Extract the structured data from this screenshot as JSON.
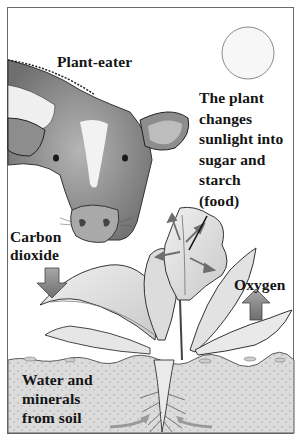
{
  "diagram": {
    "labels": {
      "plant_eater": "Plant-eater",
      "plant_process": "The plant\nchanges\nsunlight into\nsugar and\nstarch\n(food)",
      "carbon_dioxide": "Carbon\ndioxide",
      "oxygen": "Oxygen",
      "water_minerals": "Water and\nminerals\nfrom soil"
    },
    "elements": [
      {
        "name": "sun",
        "icon": "sun-circle"
      },
      {
        "name": "cow",
        "icon": "cow-head"
      },
      {
        "name": "plant",
        "icon": "leafy-plant"
      },
      {
        "name": "carbon-dioxide-arrow",
        "direction": "down"
      },
      {
        "name": "oxygen-arrow",
        "direction": "up"
      },
      {
        "name": "soil",
        "icon": "soil-layer"
      },
      {
        "name": "water-arrows",
        "direction": "inward-to-root"
      }
    ],
    "colors": {
      "border": "#6a6a6a",
      "text": "#141414",
      "soil": "#d8d8d8",
      "arrow_fill": "#8c8c8c",
      "leaf": "#e4e4e4",
      "cow": "#9a9a9a"
    }
  }
}
